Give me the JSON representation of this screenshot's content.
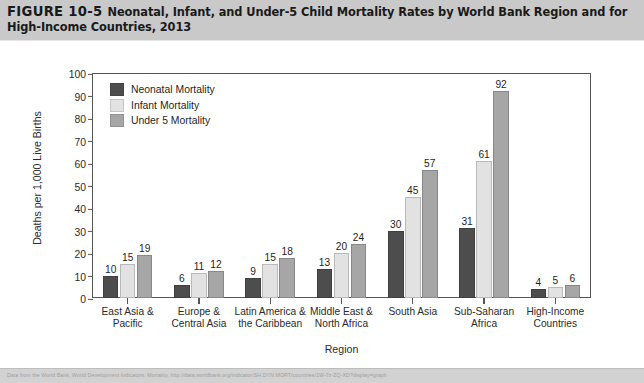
{
  "figure": {
    "number_label": "FIGURE 10-5",
    "caption": "Neonatal, Infant, and Under-5 Child Mortality Rates by World Bank Region and for High-Income Countries, 2013",
    "source_note": "Data from the World Bank, World Development Indicators: Mortality, http://data.worldbank.org/indicator/SH.DYN.MORT/countries/1W-7z-ZQ-XD?display=graph"
  },
  "colors": {
    "header_band": "#c9c9c9",
    "footer_band": "#d2d2d2",
    "axis": "#555555",
    "neonatal": "#4d4d4d",
    "infant": "#e2e2e2",
    "under5": "#a6a6a6",
    "plot_background": "#ffffff"
  },
  "chart_data": {
    "type": "bar",
    "title": "Neonatal, Infant, and Under-5 Child Mortality Rates by World Bank Region and for High-Income Countries, 2013",
    "xlabel": "Region",
    "ylabel": "Deaths per 1,000 Live Births",
    "ylim": [
      0,
      100
    ],
    "ytick_step": 10,
    "yticks": [
      100,
      90,
      80,
      70,
      60,
      50,
      40,
      30,
      20,
      10,
      0
    ],
    "grid": false,
    "legend_position": "top-left inside plot",
    "data_labels": true,
    "categories": [
      "East Asia &\nPacific",
      "Europe &\nCentral Asia",
      "Latin America &\nthe Caribbean",
      "Middle East &\nNorth Africa",
      "South Asia",
      "Sub-Saharan\nAfrica",
      "High-Income\nCountries"
    ],
    "category_lines": [
      [
        "East Asia &",
        "Pacific"
      ],
      [
        "Europe &",
        "Central Asia"
      ],
      [
        "Latin America &",
        "the Caribbean"
      ],
      [
        "Middle East &",
        "North Africa"
      ],
      [
        "South Asia",
        ""
      ],
      [
        "Sub-Saharan",
        "Africa"
      ],
      [
        "High-Income",
        "Countries"
      ]
    ],
    "series": [
      {
        "name": "Neonatal Mortality",
        "color": "#4d4d4d",
        "values": [
          10,
          6,
          9,
          13,
          30,
          31,
          4
        ]
      },
      {
        "name": "Infant Mortality",
        "color": "#e2e2e2",
        "values": [
          15,
          11,
          15,
          20,
          45,
          61,
          5
        ]
      },
      {
        "name": "Under 5 Mortality",
        "color": "#a6a6a6",
        "values": [
          19,
          12,
          18,
          24,
          57,
          92,
          6
        ]
      }
    ]
  }
}
